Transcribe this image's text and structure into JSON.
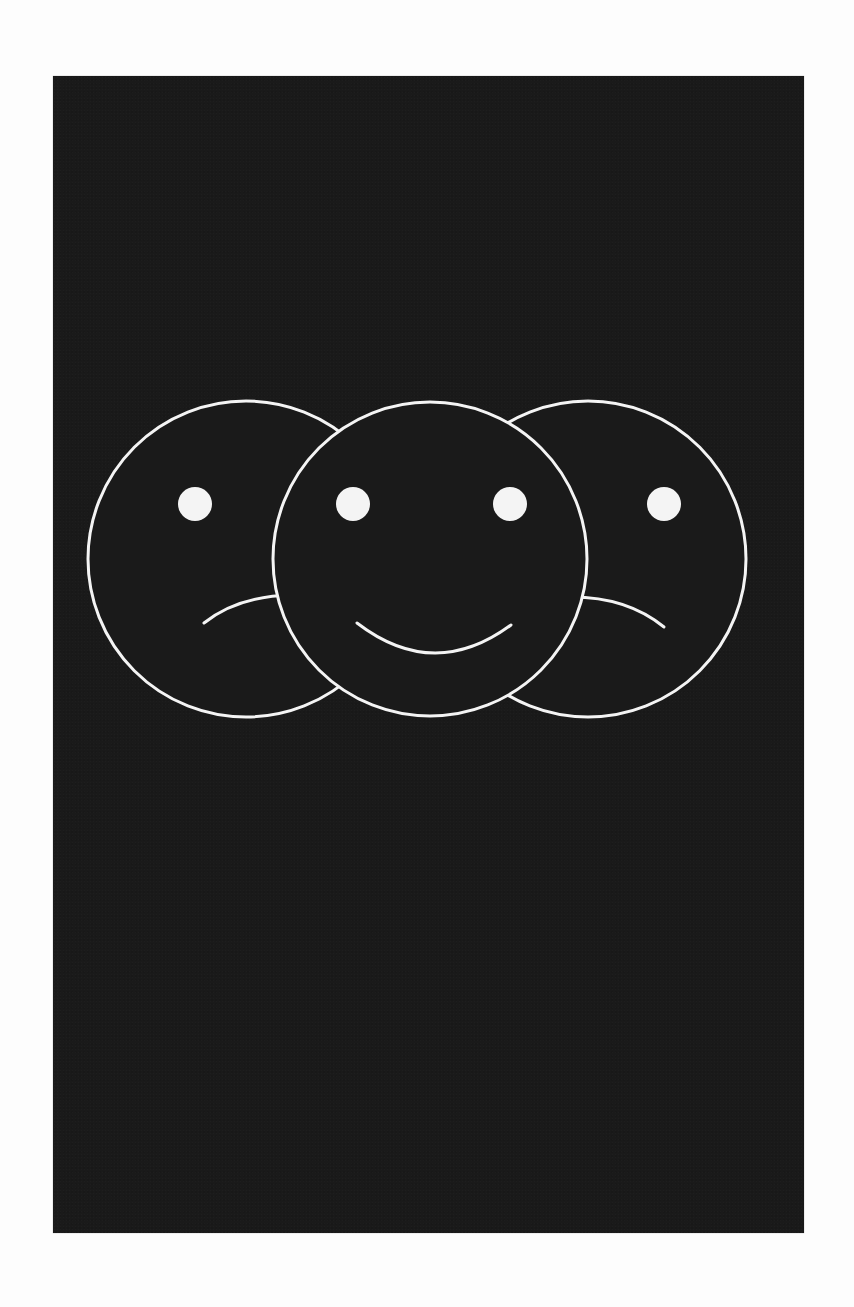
{
  "page": {
    "background": "#fdfdfd"
  },
  "card": {
    "background": "#1a1a1a",
    "bounds": {
      "left": 53,
      "top": 76,
      "right": 804,
      "bottom": 1233
    }
  },
  "illustration": {
    "description": "Three overlapping line-drawn faces: sad, happy (front), sad",
    "stroke_color": "#f4f4f4",
    "stroke_width": 3,
    "eye_radius": 17,
    "faces": [
      {
        "name": "left-face",
        "mood": "sad",
        "cx": 246,
        "cy": 559,
        "r": 158,
        "eyes": [
          {
            "cx": 195,
            "cy": 504
          }
        ]
      },
      {
        "name": "center-face",
        "mood": "happy",
        "cx": 430,
        "cy": 559,
        "r": 157,
        "eyes": [
          {
            "cx": 353,
            "cy": 504
          },
          {
            "cx": 510,
            "cy": 504
          }
        ]
      },
      {
        "name": "right-face",
        "mood": "sad",
        "cx": 588,
        "cy": 559,
        "r": 158,
        "eyes": [
          {
            "cx": 664,
            "cy": 504
          }
        ]
      }
    ]
  }
}
